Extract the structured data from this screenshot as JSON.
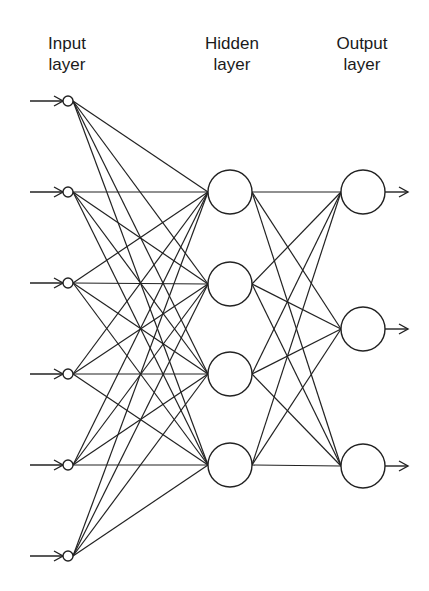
{
  "diagram": {
    "type": "feedforward-neural-network",
    "colors": {
      "stroke": "#222222",
      "background": "#ffffff",
      "text": "#1a1a1a"
    },
    "layers": [
      {
        "id": "input",
        "title_line1": "Input",
        "title_line2": "layer",
        "label_x": 67,
        "node_count": 6,
        "node_x": 68,
        "node_radius": 5,
        "node_y": [
          101,
          192,
          283,
          374,
          465,
          556
        ],
        "has_input_arrows": true
      },
      {
        "id": "hidden",
        "title_line1": "Hidden",
        "title_line2": "layer",
        "label_x": 232,
        "node_count": 4,
        "node_x": 230,
        "node_radius": 22,
        "node_y": [
          192,
          284,
          374,
          465
        ]
      },
      {
        "id": "output",
        "title_line1": "Output",
        "title_line2": "layer",
        "label_x": 362,
        "node_count": 3,
        "node_x": 363,
        "node_radius": 22,
        "node_y": [
          192,
          329,
          466
        ],
        "has_output_arrows": true
      }
    ],
    "connections": "fully-connected between adjacent layers"
  }
}
